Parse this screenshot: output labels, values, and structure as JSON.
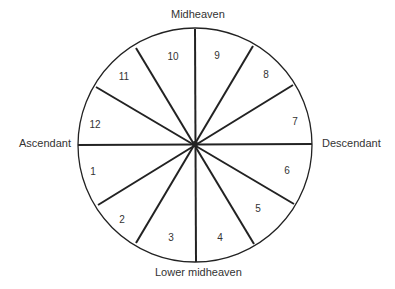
{
  "diagram": {
    "type": "astrological house wheel",
    "center": [
      195,
      144
    ],
    "radius": 117,
    "labels": {
      "top": "Midheaven",
      "bottom": "Lower midheaven",
      "left": "Ascendant",
      "right": "Descendant"
    },
    "houses": [
      {
        "number": "1",
        "x": 93,
        "y": 170
      },
      {
        "number": "2",
        "x": 122,
        "y": 218
      },
      {
        "number": "3",
        "x": 170,
        "y": 237
      },
      {
        "number": "4",
        "x": 219,
        "y": 237
      },
      {
        "number": "5",
        "x": 258,
        "y": 207
      },
      {
        "number": "6",
        "x": 287,
        "y": 169
      },
      {
        "number": "7",
        "x": 295,
        "y": 120
      },
      {
        "number": "8",
        "x": 266,
        "y": 73
      },
      {
        "number": "9",
        "x": 217,
        "y": 54
      },
      {
        "number": "10",
        "x": 173,
        "y": 55
      },
      {
        "number": "11",
        "x": 124,
        "y": 75
      },
      {
        "number": "12",
        "x": 94,
        "y": 123
      }
    ],
    "stroke_color": "#222222",
    "background": "#ffffff"
  }
}
